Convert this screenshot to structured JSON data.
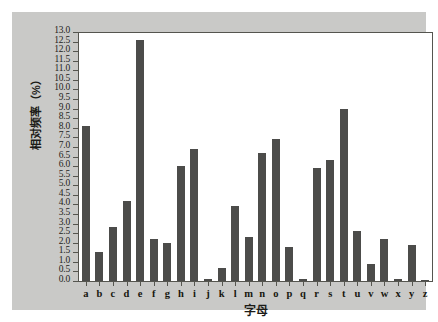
{
  "chart_data": {
    "type": "bar",
    "title": "",
    "xlabel": "字母",
    "ylabel": "相对频率（%）",
    "categories": [
      "a",
      "b",
      "c",
      "d",
      "e",
      "f",
      "g",
      "h",
      "i",
      "j",
      "k",
      "l",
      "m",
      "n",
      "o",
      "p",
      "q",
      "r",
      "s",
      "t",
      "u",
      "v",
      "w",
      "x",
      "y",
      "z"
    ],
    "values": [
      8.1,
      1.5,
      2.8,
      4.2,
      12.6,
      2.2,
      2.0,
      6.0,
      6.9,
      0.1,
      0.7,
      3.9,
      2.3,
      6.7,
      7.4,
      1.8,
      0.1,
      5.9,
      6.3,
      9.0,
      2.6,
      0.9,
      2.2,
      0.1,
      1.9,
      0.05
    ],
    "ylim": [
      0.0,
      13.0
    ],
    "ytick_step": 0.5,
    "yticks": [
      "0.0",
      "0.5",
      "1.0",
      "1.5",
      "2.0",
      "2.5",
      "3.0",
      "3.5",
      "4.0",
      "4.5",
      "5.0",
      "5.5",
      "6.0",
      "6.5",
      "7.0",
      "7.5",
      "8.0",
      "8.5",
      "9.0",
      "9.5",
      "10.0",
      "10.5",
      "11.0",
      "11.5",
      "12.0",
      "12.5",
      "13.0"
    ],
    "grid": false,
    "legend": null,
    "bar_color": "#4c4c4a",
    "plot_background": "#ffffff",
    "panel_background": "#c9c9c7",
    "axis_color": "#55554f"
  }
}
